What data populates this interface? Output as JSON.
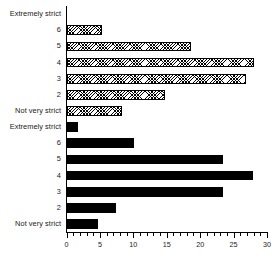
{
  "chart_data": {
    "type": "bar",
    "orientation": "horizontal",
    "title": "",
    "subtitle": "",
    "xlabel": "",
    "ylabel": "",
    "xlim": [
      0,
      30
    ],
    "ylim": null,
    "grid": false,
    "legend": null,
    "x_ticks_major": [
      0,
      5,
      10,
      15,
      20,
      25,
      30
    ],
    "x_tick_labels": [
      "0",
      "5",
      "10",
      "15",
      "20",
      "25",
      "30"
    ],
    "x_tick_minor_step": 1,
    "categories": [
      "Extremely strict",
      "6",
      "5",
      "4",
      "3",
      "2",
      "Not very strict"
    ],
    "series": [
      {
        "name": "upper",
        "fill": "hatched",
        "values": [
          0,
          5.3,
          18.5,
          28.0,
          26.8,
          14.7,
          8.3
        ]
      },
      {
        "name": "lower",
        "fill": "solid",
        "values": [
          1.7,
          10.0,
          23.3,
          27.9,
          23.3,
          7.3,
          4.6
        ]
      }
    ]
  },
  "panels": {
    "top": {
      "name": "upper-panel",
      "rows": [
        {
          "label": "Extremely strict",
          "value": 0
        },
        {
          "label": "6",
          "value": 5.3
        },
        {
          "label": "5",
          "value": 18.5
        },
        {
          "label": "4",
          "value": 28.0
        },
        {
          "label": "3",
          "value": 26.8
        },
        {
          "label": "2",
          "value": 14.7
        },
        {
          "label": "Not very strict",
          "value": 8.3
        }
      ]
    },
    "bottom": {
      "name": "lower-panel",
      "rows": [
        {
          "label": "Extremely strict",
          "value": 1.7
        },
        {
          "label": "6",
          "value": 10.0
        },
        {
          "label": "5",
          "value": 23.3
        },
        {
          "label": "4",
          "value": 27.9
        },
        {
          "label": "3",
          "value": 23.3
        },
        {
          "label": "2",
          "value": 7.3
        },
        {
          "label": "Not very strict",
          "value": 4.6
        }
      ]
    }
  },
  "colors": {
    "axis": "#000000",
    "bar_solid": "#000000",
    "bar_hatch_line": "#000000",
    "bar_hatch_background": "#ffffff",
    "text": "#1a1a1a",
    "page_background": "#ffffff"
  }
}
